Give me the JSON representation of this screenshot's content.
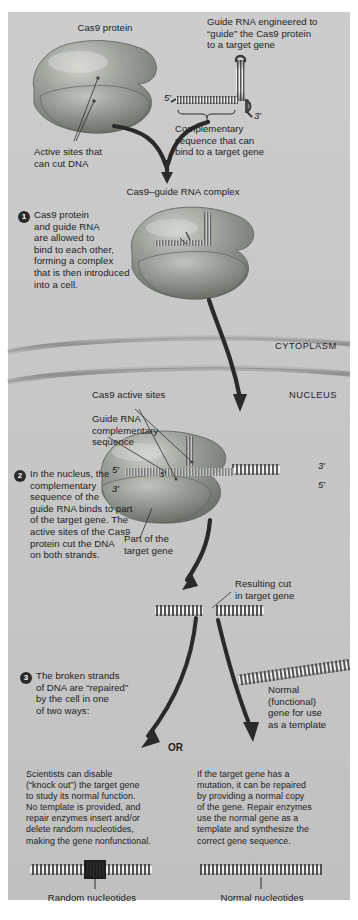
{
  "figure": {
    "topic": "CRISPR-Cas9 gene editing",
    "panel_bg": "#c9c9c9",
    "ink": "#1d1d1d"
  },
  "labels": {
    "cas9_protein": "Cas9 protein",
    "guide_rna_engineered": "Guide RNA engineered to\n“guide” the Cas9 protein\nto a target gene",
    "active_sites": "Active sites that\ncan cut DNA",
    "complementary_seq": "Complementary\nsequence that can\nbind to a target gene",
    "complex_title": "Cas9–guide RNA complex",
    "cytoplasm": "CYTOPLASM",
    "nucleus": "NUCLEUS",
    "cas9_active_sites": "Cas9 active sites",
    "guide_rna_comp_seq": "Guide RNA\ncomplementary\nsequence",
    "part_of_target_gene": "Part of the\ntarget gene",
    "resulting_cut": "Resulting cut\nin target gene",
    "normal_template_gene": "Normal\n(functional)\ngene for use\nas a template",
    "or": "OR",
    "random_nucleotides": "Random nucleotides",
    "normal_nucleotides": "Normal nucleotides"
  },
  "primes": {
    "rna_five": "5′",
    "rna_three": "3′",
    "left_outer_five": "5′",
    "left_outer_three": "3′",
    "left_inner_five": "5′",
    "right_outer_three": "3′",
    "right_outer_five": "5′"
  },
  "steps": [
    {
      "number": "1",
      "text": "Cas9 protein\nand guide RNA\nare allowed to\nbind to each other,\nforming a complex\nthat is then introduced\ninto a cell."
    },
    {
      "number": "2",
      "text": "In the nucleus, the\ncomplementary\nsequence of the\nguide RNA binds to part\nof the target gene. The\nactive sites of the Cas9\nprotein cut the DNA\non both strands."
    },
    {
      "number": "3",
      "text": "The broken strands\nof DNA are “repaired”\nby the cell in one\nof two ways:"
    }
  ],
  "outcomes": {
    "left": "Scientists can disable\n(“knock out”) the target gene\nto study its normal function.\nNo template is provided, and\nrepair enzymes insert and/or\ndelete random nucleotides,\nmaking the gene nonfunctional.",
    "right": "If the target gene has a\nmutation, it can be repaired\nby providing a normal copy\nof the gene. Repair enzymes\nuse the normal gene as a\ntemplate and synthesize the\ncorrect gene sequence."
  }
}
